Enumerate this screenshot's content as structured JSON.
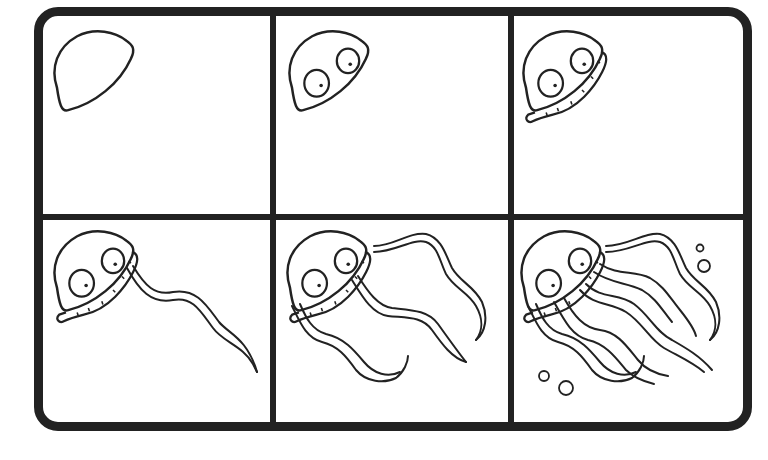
{
  "title": "How to draw a jellyfish - 6 steps",
  "colors": {
    "ink": "#222222",
    "paper": "#ffffff"
  },
  "steps": [
    {
      "number": 1,
      "label": "Step 1: dome-shaped bell"
    },
    {
      "number": 2,
      "label": "Step 2: add two eyes"
    },
    {
      "number": 3,
      "label": "Step 3: add frilly rim"
    },
    {
      "number": 4,
      "label": "Step 4: add first tentacle"
    },
    {
      "number": 5,
      "label": "Step 5: add more tentacles"
    },
    {
      "number": 6,
      "label": "Step 6: finish with all tentacles and bubbles"
    }
  ]
}
